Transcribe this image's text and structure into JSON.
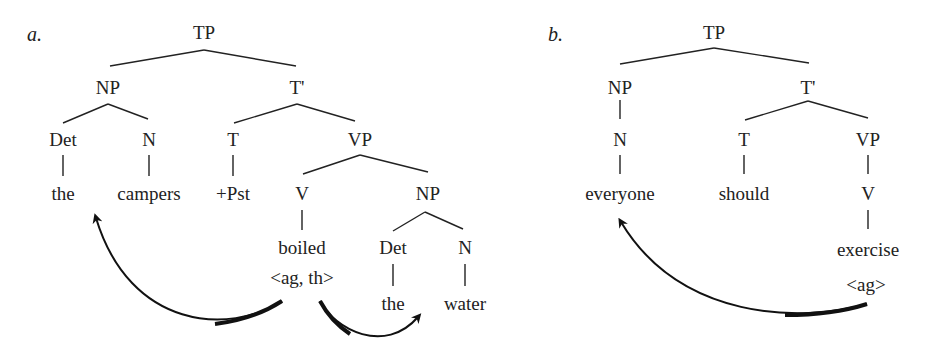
{
  "tree_a": {
    "label": "a.",
    "TP": "TP",
    "NP": "NP",
    "Tbar": "T'",
    "Det": "Det",
    "N": "N",
    "T": "T",
    "VP": "VP",
    "the": "the",
    "campers": "campers",
    "Pst": "+Pst",
    "V": "V",
    "NP2": "NP",
    "boiled": "boiled",
    "grid": "<ag, th>",
    "Det2": "Det",
    "N2": "N",
    "the2": "the",
    "water": "water"
  },
  "tree_b": {
    "label": "b.",
    "TP": "TP",
    "NP": "NP",
    "Tbar": "T'",
    "N": "N",
    "T": "T",
    "VP": "VP",
    "everyone": "everyone",
    "should": "should",
    "V": "V",
    "exercise": "exercise",
    "grid": "<ag>"
  }
}
